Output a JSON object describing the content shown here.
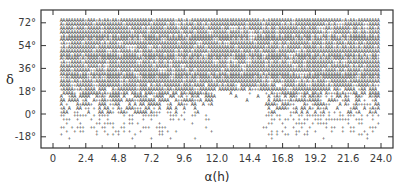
{
  "chart_data": {
    "type": "scatter",
    "title": "",
    "xlabel": "α(h)",
    "ylabel": "δ",
    "x_ticks": [
      "0",
      "2.4",
      "4.8",
      "7.2",
      "9.6",
      "12.0",
      "14.4",
      "16.8",
      "19.2",
      "21.6",
      "24.0"
    ],
    "y_ticks": [
      "72°",
      "54°",
      "36°",
      "18°",
      "0°",
      "-18°"
    ],
    "xlim": [
      0,
      24
    ],
    "ylim": [
      -28,
      82
    ],
    "grid": false,
    "legend": null,
    "markers": [
      "A",
      "+"
    ],
    "coverage": {
      "dec_top": 74,
      "dec_dense_bottom": 24,
      "dec_sparse_bottom": -20,
      "gap_ra": [
        11.6,
        15.4
      ],
      "gap_dec_top": 18,
      "ra_step": 0.2,
      "dec_step": 3.0
    }
  },
  "axes": {
    "x_title": "α(h)",
    "y_title": "δ"
  }
}
